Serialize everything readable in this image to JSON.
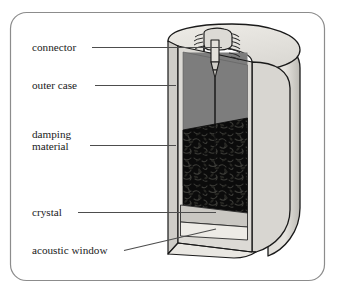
{
  "figure": {
    "frame": {
      "name": "figure-border",
      "shape": "rounded-rectangle",
      "stroke_color": "#8c8c8c",
      "fill_color": "#ffffff",
      "corner_radius": 16
    },
    "colors": {
      "outline": "#1a1a1a",
      "leader_line": "#4d4d4d",
      "outer_case_front": "#7d7d7d",
      "outer_case_shell": "#d4d2cd",
      "outer_case_shell_shade": "#c2c0ba",
      "outer_case_top": "#e3e1dc",
      "damping_material": "#0d0d0d",
      "damping_speckle": "#3a3a36",
      "crystal": "#c9c7c2",
      "acoustic_window": "#ebe9e4",
      "connector_metal": "#dcdad5",
      "label_text": "#1a1a1a"
    }
  },
  "labels": [
    {
      "id": "connector",
      "text": "connector",
      "text_x": 32,
      "text_y": 51,
      "leader": {
        "x1": 92,
        "y1": 47.5,
        "x2": 222,
        "y2": 47.5
      }
    },
    {
      "id": "outer-case",
      "text": "outer case",
      "text_x": 32,
      "text_y": 89,
      "leader": {
        "x1": 95,
        "y1": 85.5,
        "x2": 176,
        "y2": 85.5
      }
    },
    {
      "id": "damping-material-line1",
      "text": "damping",
      "text_x": 32,
      "text_y": 138,
      "leader": null
    },
    {
      "id": "damping-material-line2",
      "text": "material",
      "text_x": 32,
      "text_y": 150,
      "leader": {
        "x1": 90,
        "y1": 145.5,
        "x2": 176,
        "y2": 145.5
      }
    },
    {
      "id": "crystal",
      "text": "crystal",
      "text_x": 32,
      "text_y": 216,
      "leader": {
        "x1": 78,
        "y1": 212.5,
        "x2": 216,
        "y2": 212.5
      }
    },
    {
      "id": "acoustic-window",
      "text": "acoustic window",
      "text_x": 32,
      "text_y": 254,
      "leader": {
        "x1": 124,
        "y1": 250.5,
        "x2": 216,
        "y2": 229
      }
    }
  ],
  "components": [
    {
      "id": "outer-case",
      "label": "outer case",
      "description": "Outer cylindrical housing shell surrounding the transducer"
    },
    {
      "id": "connector",
      "label": "connector",
      "description": "Threaded coaxial connector on the top face with central pin"
    },
    {
      "id": "damping-material",
      "label": "damping material",
      "description": "Dark speckled backing block behind the crystal"
    },
    {
      "id": "crystal",
      "label": "crystal",
      "description": "Piezoelectric crystal layer at the base"
    },
    {
      "id": "acoustic-window",
      "label": "acoustic window",
      "description": "Front face layer below the crystal emitting the beam"
    }
  ]
}
